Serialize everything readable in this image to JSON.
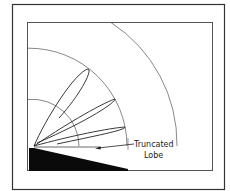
{
  "diagram": {
    "type": "antenna-radiation-pattern",
    "annotation": {
      "line1": "Truncated",
      "line2": "Lobe"
    },
    "lobes": [
      {
        "name": "upper-lobe",
        "tip": [
          88,
          69
        ]
      },
      {
        "name": "middle-lobe",
        "tip": [
          115,
          99
        ]
      },
      {
        "name": "lower-lobe",
        "tip": [
          125,
          127
        ]
      },
      {
        "name": "truncated-lobe",
        "tip": [
          96,
          148
        ]
      }
    ],
    "range_arcs": [
      {
        "name": "inner-arc",
        "radius": 47
      },
      {
        "name": "middle-arc",
        "radius": 93
      },
      {
        "name": "outer-arc",
        "radius": 143
      }
    ],
    "colors": {
      "stroke": "#333333",
      "ground": "#0a0a0a",
      "frame": "#444444"
    }
  }
}
